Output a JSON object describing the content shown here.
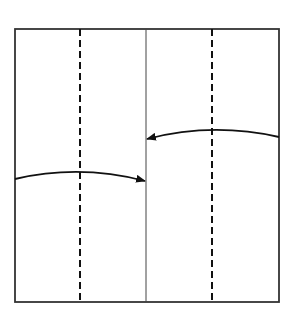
{
  "diagram": {
    "type": "paper-folding-instruction",
    "colors": {
      "background": "#ffffff",
      "stroke": "#222222"
    },
    "square": {
      "x": 15,
      "y": 29,
      "width": 264,
      "height": 273
    },
    "center_line_x": 146,
    "dashed_lines_x": [
      80,
      212
    ],
    "arrows": [
      {
        "name": "fold-left-edge-to-center",
        "from": [
          15,
          179
        ],
        "to": [
          146,
          181
        ],
        "direction": "right"
      },
      {
        "name": "fold-right-edge-to-center",
        "from": [
          279,
          137
        ],
        "to": [
          146,
          139
        ],
        "direction": "left"
      }
    ]
  }
}
